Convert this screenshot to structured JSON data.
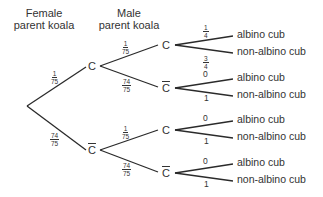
{
  "headers": {
    "female": [
      "Female",
      "parent koala"
    ],
    "male": [
      "Male",
      "parent koala"
    ]
  },
  "nodes": {
    "level1_top": "C",
    "level1_bottom": "C",
    "level2": [
      "C",
      "C",
      "C",
      "C"
    ]
  },
  "branch_probs": {
    "root_to_C": {
      "n": "1",
      "d": "75"
    },
    "root_to_Cbar": {
      "n": "74",
      "d": "75"
    },
    "C_to_C": {
      "n": "1",
      "d": "75"
    },
    "C_to_Cbar": {
      "n": "74",
      "d": "75"
    },
    "Cbar_to_C": {
      "n": "1",
      "d": "75"
    },
    "Cbar_to_Cbar": {
      "n": "74",
      "d": "75"
    },
    "leaf_probs": [
      {
        "albino": {
          "n": "1",
          "d": "4"
        },
        "non_albino": {
          "n": "3",
          "d": "4"
        }
      },
      {
        "albino": "0",
        "non_albino": "1"
      },
      {
        "albino": "0",
        "non_albino": "1"
      },
      {
        "albino": "0",
        "non_albino": "1"
      }
    ]
  },
  "leaves": {
    "albino": "albino cub",
    "non_albino": "non-albino cub"
  }
}
